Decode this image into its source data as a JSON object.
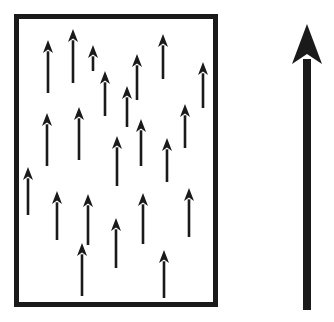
{
  "figure": {
    "type": "vector-field-diagram",
    "canvas": {
      "width": 334,
      "height": 322
    },
    "colors": {
      "background": "#ffffff",
      "ink": "#1a1a1a",
      "border": "#1a1a1a"
    }
  },
  "domain_box": {
    "label": "domain-boundary-rectangle",
    "x": 14,
    "y": 14,
    "width": 204,
    "height": 293,
    "stroke_width": 5,
    "fill": "#ffffff"
  },
  "moment_arrows": {
    "label": "aligned-magnetic-moment-arrows",
    "count": 22,
    "direction": "up",
    "stroke_width": 2.6,
    "head_width": 10,
    "head_height": 13,
    "head_notch": 3.4,
    "items": [
      {
        "x": 48,
        "y_tip": 40,
        "y_tail": 93
      },
      {
        "x": 73,
        "y_tip": 29,
        "y_tail": 83
      },
      {
        "x": 105,
        "y_tip": 71,
        "y_tail": 116
      },
      {
        "x": 137,
        "y_tip": 54,
        "y_tail": 100
      },
      {
        "x": 163,
        "y_tip": 34,
        "y_tail": 79
      },
      {
        "x": 203,
        "y_tip": 62,
        "y_tail": 108
      },
      {
        "x": 47,
        "y_tip": 113,
        "y_tail": 166
      },
      {
        "x": 79,
        "y_tip": 107,
        "y_tail": 160
      },
      {
        "x": 117,
        "y_tip": 136,
        "y_tail": 186
      },
      {
        "x": 141,
        "y_tip": 119,
        "y_tail": 166
      },
      {
        "x": 167,
        "y_tip": 138,
        "y_tail": 182
      },
      {
        "x": 185,
        "y_tip": 104,
        "y_tail": 148
      },
      {
        "x": 28,
        "y_tip": 167,
        "y_tail": 215
      },
      {
        "x": 57,
        "y_tip": 191,
        "y_tail": 240
      },
      {
        "x": 88,
        "y_tip": 194,
        "y_tail": 245
      },
      {
        "x": 116,
        "y_tip": 218,
        "y_tail": 268
      },
      {
        "x": 143,
        "y_tip": 193,
        "y_tail": 244
      },
      {
        "x": 189,
        "y_tip": 188,
        "y_tail": 237
      },
      {
        "x": 82,
        "y_tip": 243,
        "y_tail": 296
      },
      {
        "x": 164,
        "y_tip": 250,
        "y_tail": 298
      },
      {
        "x": 127,
        "y_tip": 86,
        "y_tail": 127
      },
      {
        "x": 93,
        "y_tip": 45,
        "y_tail": 71
      }
    ]
  },
  "net_arrow": {
    "label": "net-magnetization-vector",
    "direction": "up",
    "x": 307,
    "y_tip": 24,
    "y_tail": 310,
    "stroke_width": 8,
    "head_width": 30,
    "head_height": 40,
    "head_notch": 10
  }
}
